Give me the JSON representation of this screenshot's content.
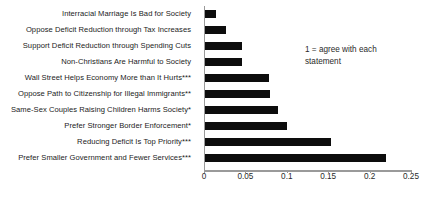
{
  "chart_data": {
    "type": "bar",
    "orientation": "horizontal",
    "title": "",
    "xlabel": "",
    "ylabel": "",
    "xlim": [
      0,
      0.25
    ],
    "grid": false,
    "legend": null,
    "bar_color": "#0d0d0d",
    "categories": [
      "Interracial Marriage Is Bad for Society",
      "Oppose Deficit Reduction through Tax Increases",
      "Support Deficit Reduction through Spending Cuts",
      "Non-Christians Are Harmful to Society",
      "Wall Street Helps Economy More than It Hurts***",
      "Oppose Path to Citizenship for Illegal Immigrants**",
      "Same-Sex Couples Raising Children Harms Society*",
      "Prefer Stronger Border Enforcement*",
      "Reducing Deficit Is Top Priority***",
      "Prefer Smaller Government and Fewer Services***"
    ],
    "values": [
      0.013,
      0.025,
      0.045,
      0.045,
      0.077,
      0.078,
      0.088,
      0.099,
      0.152,
      0.219
    ],
    "xticks": [
      0,
      0.05,
      0.1,
      0.15,
      0.2,
      0.25
    ],
    "xtick_labels": [
      "0",
      "0.05",
      "0.1",
      "0.15",
      "0.2",
      "0.25"
    ],
    "annotations": [
      {
        "text": "1 = agree with each statement",
        "line1": "1 = agree with each",
        "line2": "statement"
      }
    ]
  }
}
